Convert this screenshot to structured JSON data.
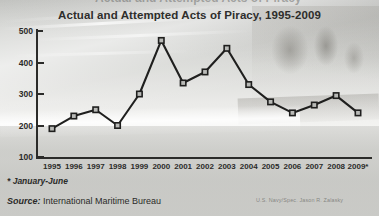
{
  "figure": {
    "title": "Actual and Attempted Acts of Piracy, 1995-2009",
    "clipped_top_text": "Actual and Attempted Acts of Piracy",
    "footnote": "* January-June",
    "source_label": "Source:",
    "source_value": "International Maritime Bureau",
    "photo_credit": "U.S. Navy/Spec. Jason R. Zalasky",
    "background_image": "faded-photo-of-boat-and-sailors"
  },
  "colors": {
    "line": "#1f1f1e",
    "marker_fill": "#b9bab7",
    "axis": "#2b2b29",
    "text": "#2e2e2c",
    "background": "#cfd0ce"
  },
  "chart_data": {
    "type": "line",
    "title": "Actual and Attempted Acts of Piracy, 1995-2009",
    "xlabel": "",
    "ylabel": "",
    "categories": [
      "1995",
      "1996",
      "1997",
      "1998",
      "1999",
      "2000",
      "2001",
      "2002",
      "2003",
      "2004",
      "2005",
      "2006",
      "2007",
      "2008",
      "2009*"
    ],
    "values": [
      190,
      230,
      250,
      200,
      300,
      470,
      335,
      370,
      445,
      330,
      275,
      240,
      265,
      295,
      240
    ],
    "ylim": [
      100,
      500
    ],
    "yticks": [
      "100",
      "200",
      "300",
      "400",
      "500"
    ],
    "grid": false,
    "legend": "none",
    "marker": "square",
    "annotations": [
      "* January-June"
    ]
  }
}
